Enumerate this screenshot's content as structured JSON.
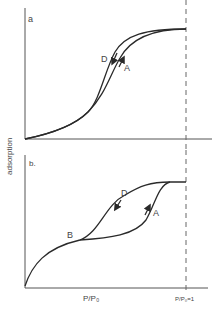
{
  "figure": {
    "y_axis_label": "adsorption",
    "x_axis_label": "P/P₀",
    "x_tick_saturation": "P/P₀=1",
    "line_color": "#2a2a2a",
    "panels": [
      {
        "id": "a",
        "label": "a",
        "curve_labels": {
          "desorption": "D",
          "adsorption": "A"
        }
      },
      {
        "id": "b",
        "label": "b.",
        "curve_labels": {
          "desorption": "D",
          "adsorption": "A",
          "point": "B"
        }
      }
    ]
  }
}
